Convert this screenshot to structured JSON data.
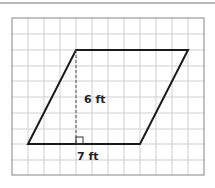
{
  "figure": {
    "shape": "parallelogram",
    "height_label": "6 ft",
    "base_label": "7 ft",
    "grid": {
      "cols": 12,
      "rows": 10,
      "cell_px": 16
    },
    "vertices": {
      "top_left": [
        76,
        50
      ],
      "top_right": [
        188,
        50
      ],
      "bottom_right": [
        140,
        144
      ],
      "bottom_left": [
        28,
        144
      ]
    },
    "colors": {
      "grid": "#cfcfcf",
      "frame": "#9a9a9a",
      "shape": "#1a1a1a"
    }
  }
}
